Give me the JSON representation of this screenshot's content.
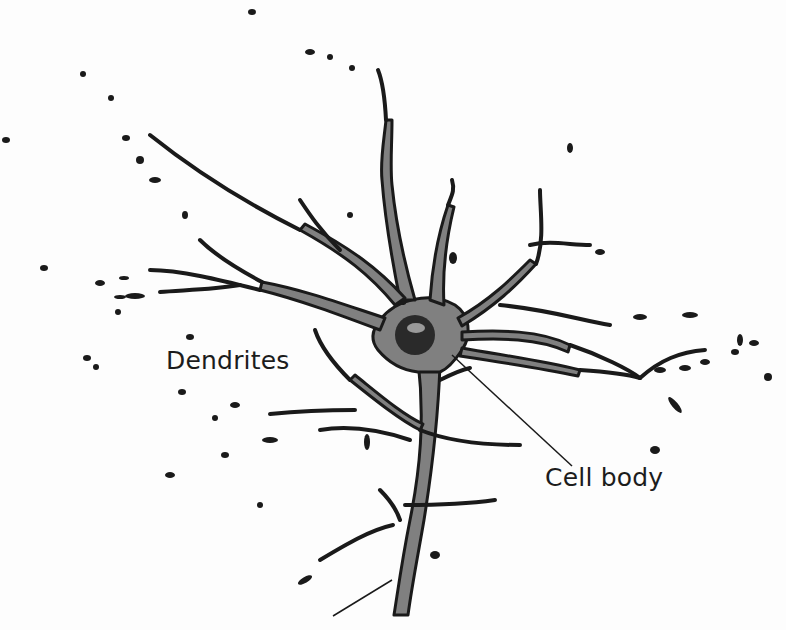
{
  "diagram": {
    "labels": {
      "dendrites": "Dendrites",
      "cell_body": "Cell body"
    },
    "colors": {
      "background": "#fdfdfd",
      "cytoplasm_fill": "#808080",
      "outline": "#1a1a1a",
      "nucleus": "#2a2a2a",
      "nucleolus": "#9a9a9a",
      "text": "#1c1c1c"
    }
  }
}
